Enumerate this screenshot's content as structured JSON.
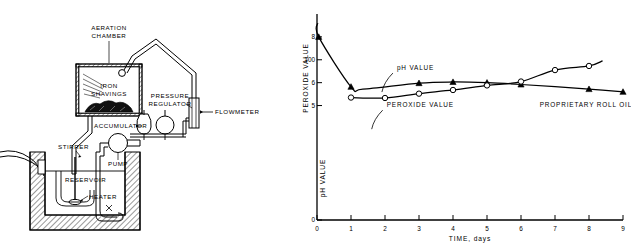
{
  "figure": {
    "panels": [
      "apparatus-diagram",
      "oxidation-chart"
    ]
  },
  "apparatus": {
    "labels": {
      "aeration_chamber_line1": "AERATION",
      "aeration_chamber_line2": "CHAMBER",
      "iron_shavings_line1": "IRON",
      "iron_shavings_line2": "SHAVINGS",
      "accumulator": "ACCUMULATOR",
      "pressure_regulator_line1": "PRESSURE",
      "pressure_regulator_line2": "REGULATOR",
      "flowmeter": "FLOWMETER",
      "pump": "PUMP",
      "stirrer": "STIRRER",
      "reservoir": "RESERVOIR",
      "heater": "HEATER"
    }
  },
  "chart_data": {
    "type": "line",
    "title": "",
    "xlabel": "TIME, days",
    "ylabel_left_upper": "PEROXIDE VALUE",
    "ylabel_left_lower": "pH VALUE",
    "xlim": [
      0,
      9
    ],
    "xticks": [
      0,
      1,
      2,
      3,
      4,
      5,
      6,
      7,
      8,
      9
    ],
    "xtick_labels": [
      "0",
      "1",
      "2",
      "3",
      "4",
      "5",
      "6",
      "7",
      "8",
      "9"
    ],
    "ylim": [
      0,
      9
    ],
    "yticks": [
      0,
      5,
      6,
      7,
      8
    ],
    "ytick_labels": [
      "0",
      "5",
      "6",
      "100",
      "8"
    ],
    "grid": false,
    "legend": "annotations",
    "annotations": [
      {
        "text": "pH VALUE",
        "x": 2.35,
        "y": 6.55,
        "marker": "triangle-filled"
      },
      {
        "text": "PEROXIDE VALUE",
        "x": 2.05,
        "y": 4.93,
        "marker": "circle-open"
      },
      {
        "text": "PROPRIETARY ROLL OIL",
        "x": 6.55,
        "y": 4.95,
        "marker": "none"
      }
    ],
    "series": [
      {
        "name": "pH VALUE",
        "marker": "triangle-filled",
        "x": [
          0.05,
          1.0,
          3.0,
          4.0,
          5.0,
          6.0,
          8.0,
          9.0
        ],
        "y": [
          8.0,
          5.82,
          5.98,
          6.03,
          6.0,
          5.92,
          5.72,
          5.6
        ],
        "curve_start": [
          0.02,
          8.6
        ],
        "curve_min": [
          1.35,
          5.72
        ]
      },
      {
        "name": "PEROXIDE VALUE",
        "marker": "circle-open",
        "x": [
          1.0,
          2.0,
          3.0,
          4.0,
          5.0,
          6.0,
          7.0,
          8.0
        ],
        "y": [
          5.35,
          5.33,
          5.52,
          5.68,
          5.88,
          6.05,
          6.55,
          6.73
        ],
        "curve_end": [
          8.4,
          6.95
        ]
      }
    ]
  }
}
